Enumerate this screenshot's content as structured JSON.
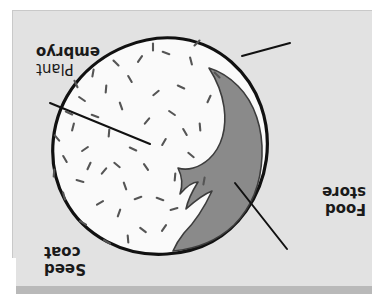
{
  "page": {
    "orientation": "upside-down",
    "rotation_degrees": 180
  },
  "colors": {
    "page_background": "#ffffff",
    "panel_background": "#e2e2e2",
    "panel_bottom_strip": "#b9b9b9",
    "panel_border": "#c9c9c9",
    "seed_fill": "#fafafa",
    "seed_outline": "#111111",
    "embryo_fill": "#8a8a8a",
    "embryo_outline": "#3c3c3c",
    "speckle": "#555555",
    "leader_line": "#111111",
    "label_text": "#1a1a1a"
  },
  "diagram": {
    "type": "labelled-botanical-diagram",
    "subject": "seed",
    "labels": [
      {
        "id": "plant-embryo",
        "line1": "Plant",
        "line2": "embryo",
        "line1_weight": "normal",
        "line2_weight": "bold",
        "leader_from": [
          85,
          50
        ],
        "leader_to": [
          137,
          116
        ]
      },
      {
        "id": "food-store",
        "line1": "Food",
        "line2": "store",
        "line1_weight": "bold",
        "line2_weight": "bold",
        "leader_from": [
          322,
          196
        ],
        "leader_to": [
          222,
          155
        ]
      },
      {
        "id": "seed-coat",
        "line1": "Seed",
        "line2": "coat",
        "line1_weight": "bold",
        "line2_weight": "bold",
        "leader_from": [
          82,
          256
        ],
        "leader_to": [
          130,
          243
        ]
      }
    ],
    "regions": [
      {
        "id": "seed-coat-outline",
        "description": "outer oval boundary of the seed"
      },
      {
        "id": "food-store",
        "description": "large speckled pale interior of the seed"
      },
      {
        "id": "plant-embryo",
        "description": "grey hooked crescent at the upper-left inside the seed"
      }
    ],
    "speckles": [
      [
        229,
        69,
        38
      ],
      [
        253,
        86,
        110
      ],
      [
        212,
        100,
        20
      ],
      [
        247,
        113,
        70
      ],
      [
        272,
        96,
        150
      ],
      [
        289,
        76,
        30
      ],
      [
        197,
        122,
        95
      ],
      [
        226,
        132,
        55
      ],
      [
        268,
        128,
        130
      ],
      [
        292,
        118,
        15
      ],
      [
        308,
        103,
        75
      ],
      [
        181,
        144,
        40
      ],
      [
        208,
        157,
        120
      ],
      [
        239,
        150,
        25
      ],
      [
        263,
        166,
        95
      ],
      [
        287,
        150,
        145
      ],
      [
        307,
        140,
        60
      ],
      [
        172,
        172,
        85
      ],
      [
        200,
        186,
        35
      ],
      [
        225,
        178,
        130
      ],
      [
        251,
        193,
        70
      ],
      [
        277,
        183,
        20
      ],
      [
        299,
        172,
        105
      ],
      [
        315,
        161,
        50
      ],
      [
        163,
        200,
        115
      ],
      [
        191,
        212,
        25
      ],
      [
        216,
        206,
        140
      ],
      [
        242,
        220,
        60
      ],
      [
        266,
        210,
        95
      ],
      [
        290,
        200,
        35
      ],
      [
        181,
        238,
        75
      ],
      [
        206,
        246,
        20
      ],
      [
        232,
        240,
        125
      ],
      [
        256,
        236,
        45
      ],
      [
        279,
        226,
        100
      ],
      [
        198,
        90,
        165
      ],
      [
        244,
        60,
        85
      ],
      [
        296,
        215,
        65
      ],
      [
        155,
        224,
        45
      ],
      [
        168,
        118,
        100
      ],
      [
        265,
        57,
        30
      ],
      [
        219,
        252,
        90
      ],
      [
        303,
        186,
        25
      ],
      [
        175,
        256,
        135
      ],
      [
        187,
        167,
        60
      ],
      [
        255,
        134,
        40
      ],
      [
        283,
        133,
        115
      ],
      [
        234,
        101,
        160
      ],
      [
        208,
        71,
        125
      ],
      [
        318,
        126,
        95
      ]
    ]
  }
}
